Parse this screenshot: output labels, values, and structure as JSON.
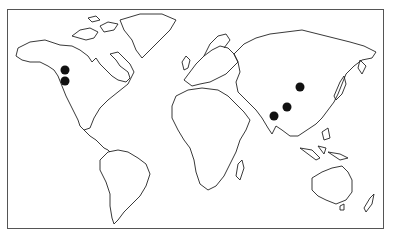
{
  "map": {
    "type": "world outline map",
    "frame": {
      "left": 7,
      "top": 9,
      "right": 385,
      "bottom": 230,
      "stroke": "#555555"
    },
    "markers": [
      {
        "id": "na-1",
        "region": "Western Canada",
        "x": 65,
        "y": 70,
        "r": 4.5,
        "color": "#111111"
      },
      {
        "id": "na-2",
        "region": "Western Canada",
        "x": 65,
        "y": 81,
        "r": 4.5,
        "color": "#111111"
      },
      {
        "id": "asia-1",
        "region": "China",
        "x": 300,
        "y": 87,
        "r": 4.5,
        "color": "#111111"
      },
      {
        "id": "asia-2",
        "region": "Himalaya / Nepal",
        "x": 287,
        "y": 107,
        "r": 4.5,
        "color": "#111111"
      },
      {
        "id": "asia-3",
        "region": "India",
        "x": 274,
        "y": 116,
        "r": 4.5,
        "color": "#111111"
      }
    ]
  }
}
